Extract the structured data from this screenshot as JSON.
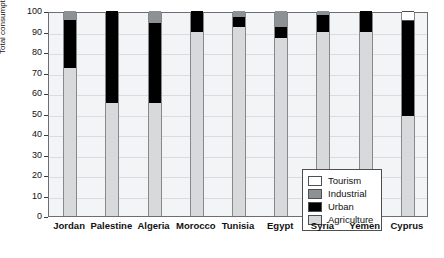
{
  "chart_data": {
    "type": "bar",
    "title": "",
    "subtitle": "",
    "xlabel": "",
    "ylabel": "Total consumption (%)",
    "ylim": [
      0,
      100
    ],
    "ytick_values": [
      0,
      10,
      20,
      30,
      40,
      50,
      60,
      70,
      80,
      90,
      100
    ],
    "ytick_labels": [
      "0",
      "10",
      "20",
      "30",
      "40",
      "50",
      "60",
      "70",
      "80",
      "90",
      "100"
    ],
    "grid": true,
    "stacked": true,
    "legend_position": "inside-lower-right",
    "categories": [
      "Jordan",
      "Palestine",
      "Algeria",
      "Morocco",
      "Tunisia",
      "Egypt",
      "Syria",
      "Yemen",
      "Cyprus"
    ],
    "series": [
      {
        "name": "Agriculture",
        "color": "#d7d9db",
        "values": [
          72,
          55,
          55,
          90,
          92,
          87,
          90,
          90,
          49
        ]
      },
      {
        "name": "Urban",
        "color": "#000000",
        "values": [
          23.5,
          45,
          39,
          10,
          5,
          5,
          8,
          10,
          46
        ]
      },
      {
        "name": "Industrial",
        "color": "#8e9194",
        "values": [
          4.5,
          0,
          6,
          0,
          3,
          8,
          2,
          0,
          0
        ]
      },
      {
        "name": "Tourism",
        "color": "#ffffff",
        "values": [
          0,
          0,
          0,
          0,
          0,
          0,
          0,
          0,
          5
        ]
      }
    ],
    "legend_entries": [
      {
        "label": "Tourism",
        "color": "#ffffff"
      },
      {
        "label": "Industrial",
        "color": "#8e9194"
      },
      {
        "label": "Urban",
        "color": "#000000"
      },
      {
        "label": "Agriculture",
        "color": "#d7d9db"
      }
    ]
  }
}
